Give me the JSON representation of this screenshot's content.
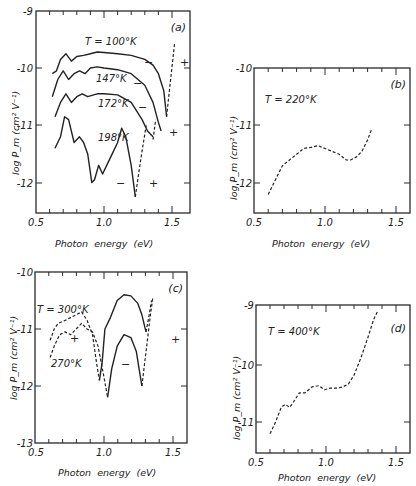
{
  "figure": {
    "x_axis_label": "Photon  energy  (eV)",
    "y_axis_label_m": "log  P_m  (cm² V⁻¹)",
    "x_ticks": [
      "0.5",
      "1.0",
      "1.5"
    ]
  },
  "panels": {
    "a": {
      "tag": "(a)",
      "y_ticks": [
        "-9",
        "-10",
        "-11",
        "-12"
      ],
      "curve_labels": [
        "T = 100°K",
        "147°K",
        "172°K",
        "198°K"
      ],
      "signs": [
        "−",
        "−",
        "−",
        "−",
        "+",
        "+",
        "+"
      ]
    },
    "b": {
      "tag": "(b)",
      "y_ticks": [
        "-10",
        "-11",
        "-12"
      ],
      "curve_labels": [
        "T = 220°K"
      ]
    },
    "c": {
      "tag": "(c)",
      "y_ticks": [
        "-10",
        "-11",
        "-12",
        "-13"
      ],
      "curve_labels": [
        "T = 300°K",
        "270°K"
      ],
      "signs": [
        "+",
        "−",
        "+"
      ]
    },
    "d": {
      "tag": "(d)",
      "y_ticks": [
        "-9",
        "-10",
        "-11"
      ],
      "curve_labels": [
        "T = 400°K"
      ]
    }
  },
  "chart_data": [
    {
      "type": "line",
      "title": "(a)",
      "xlabel": "Photon energy (eV)",
      "ylabel": "log P_m (cm^2 V^-1)",
      "xlim": [
        0.5,
        1.6
      ],
      "ylim": [
        -12.5,
        -9
      ],
      "x_ticks": [
        0.5,
        1.0,
        1.5
      ],
      "y_ticks": [
        -9,
        -10,
        -11,
        -12
      ],
      "grid": false,
      "series": [
        {
          "name": "T = 100°K",
          "style": "solid",
          "x": [
            0.62,
            0.65,
            0.68,
            0.72,
            0.76,
            0.8,
            0.85,
            0.9,
            0.95,
            1.0,
            1.1,
            1.2,
            1.3,
            1.36,
            1.4,
            1.44,
            1.46
          ],
          "y": [
            -10.1,
            -10.05,
            -9.85,
            -9.75,
            -9.88,
            -9.8,
            -9.78,
            -9.75,
            -9.72,
            -9.73,
            -9.75,
            -9.78,
            -9.85,
            -9.95,
            -10.1,
            -10.4,
            -10.85
          ]
        },
        {
          "name": "147°K",
          "style": "solid",
          "x": [
            0.62,
            0.66,
            0.7,
            0.74,
            0.78,
            0.82,
            0.86,
            0.9,
            0.95,
            1.0,
            1.1,
            1.2,
            1.3,
            1.36,
            1.4,
            1.42
          ],
          "y": [
            -10.5,
            -10.2,
            -10.05,
            -10.2,
            -10.1,
            -10.05,
            -10.1,
            -10.0,
            -9.98,
            -10.0,
            -10.03,
            -10.1,
            -10.3,
            -10.6,
            -10.95,
            -11.1
          ]
        },
        {
          "name": "172°K",
          "style": "solid",
          "x": [
            0.64,
            0.68,
            0.72,
            0.76,
            0.8,
            0.84,
            0.88,
            0.95,
            1.0,
            1.1,
            1.2,
            1.28,
            1.32,
            1.36
          ],
          "y": [
            -10.85,
            -10.6,
            -10.45,
            -10.6,
            -10.5,
            -10.45,
            -10.5,
            -10.45,
            -10.45,
            -10.47,
            -10.6,
            -10.9,
            -11.1,
            -11.2
          ]
        },
        {
          "name": "198°K",
          "style": "solid",
          "x": [
            0.64,
            0.68,
            0.71,
            0.74,
            0.78,
            0.82,
            0.85,
            0.88,
            0.91,
            0.93,
            0.96,
            0.99,
            1.02,
            1.06,
            1.1,
            1.13,
            1.16,
            1.2,
            1.23
          ],
          "y": [
            -11.4,
            -11.2,
            -10.85,
            -10.9,
            -11.3,
            -11.2,
            -11.3,
            -11.5,
            -12.0,
            -11.95,
            -11.7,
            -11.85,
            -11.7,
            -11.5,
            -11.3,
            -11.05,
            -11.2,
            -11.7,
            -12.25
          ]
        },
        {
          "name": "198°K (+)",
          "style": "dashed",
          "x": [
            1.23,
            1.27,
            1.31
          ],
          "y": [
            -12.25,
            -11.6,
            -11.0
          ]
        },
        {
          "name": "172°K (+)",
          "style": "dashed",
          "x": [
            1.36,
            1.38
          ],
          "y": [
            -11.25,
            -10.9
          ]
        },
        {
          "name": "100°K (+)",
          "style": "dashed",
          "x": [
            1.46,
            1.49,
            1.52
          ],
          "y": [
            -10.85,
            -10.2,
            -9.55
          ]
        }
      ]
    },
    {
      "type": "line",
      "title": "(b)",
      "xlabel": "Photon energy (eV)",
      "ylabel": "log P_m (cm^2 V^-1)",
      "xlim": [
        0.5,
        1.6
      ],
      "ylim": [
        -12.5,
        -10
      ],
      "x_ticks": [
        0.5,
        1.0,
        1.5
      ],
      "y_ticks": [
        -10,
        -11,
        -12
      ],
      "grid": false,
      "series": [
        {
          "name": "T = 220°K",
          "style": "dashed",
          "x": [
            0.6,
            0.65,
            0.7,
            0.75,
            0.8,
            0.85,
            0.9,
            0.95,
            1.0,
            1.05,
            1.1,
            1.15,
            1.18,
            1.22,
            1.26,
            1.3,
            1.33
          ],
          "y": [
            -12.2,
            -11.95,
            -11.7,
            -11.6,
            -11.5,
            -11.4,
            -11.38,
            -11.35,
            -11.4,
            -11.45,
            -11.5,
            -11.6,
            -11.6,
            -11.55,
            -11.45,
            -11.25,
            -11.05
          ]
        }
      ]
    },
    {
      "type": "line",
      "title": "(c)",
      "xlabel": "Photon energy (eV)",
      "ylabel": "log P_m (cm^2 V^-1)",
      "xlim": [
        0.5,
        1.6
      ],
      "ylim": [
        -13,
        -10
      ],
      "x_ticks": [
        0.5,
        1.0,
        1.5
      ],
      "y_ticks": [
        -10,
        -11,
        -12,
        -13
      ],
      "grid": false,
      "series": [
        {
          "name": "T = 300°K (+)",
          "style": "dashed",
          "x": [
            0.61,
            0.64,
            0.67,
            0.72,
            0.76,
            0.8,
            0.84,
            0.88,
            0.92,
            0.95,
            0.97
          ],
          "y": [
            -11.2,
            -11.0,
            -10.9,
            -10.85,
            -10.8,
            -10.75,
            -10.7,
            -10.85,
            -11.1,
            -11.6,
            -11.9
          ]
        },
        {
          "name": "T = 300°K (−)",
          "style": "solid",
          "x": [
            0.97,
            0.99,
            1.01,
            1.05,
            1.1,
            1.15,
            1.2,
            1.25,
            1.28,
            1.3,
            1.31
          ],
          "y": [
            -11.9,
            -11.6,
            -11.0,
            -10.8,
            -10.5,
            -10.4,
            -10.42,
            -10.55,
            -10.75,
            -10.95,
            -11.05
          ]
        },
        {
          "name": "T = 300°K (+, high)",
          "style": "dashed",
          "x": [
            1.31,
            1.33,
            1.35
          ],
          "y": [
            -11.05,
            -10.8,
            -10.5
          ]
        },
        {
          "name": "270°K (+)",
          "style": "dashed",
          "x": [
            0.61,
            0.64,
            0.68,
            0.72,
            0.76,
            0.8,
            0.84,
            0.88,
            0.92,
            0.96,
            1.0,
            1.03
          ],
          "y": [
            -11.5,
            -11.3,
            -11.1,
            -11.05,
            -11.1,
            -11.0,
            -10.9,
            -11.0,
            -11.05,
            -11.3,
            -11.8,
            -12.2
          ]
        },
        {
          "name": "270°K (−)",
          "style": "solid",
          "x": [
            1.03,
            1.06,
            1.1,
            1.15,
            1.2,
            1.24,
            1.26,
            1.28
          ],
          "y": [
            -12.2,
            -11.7,
            -11.3,
            -11.1,
            -11.15,
            -11.4,
            -11.7,
            -12.0
          ]
        },
        {
          "name": "270°K (+, high)",
          "style": "dashed",
          "x": [
            1.28,
            1.31,
            1.34,
            1.36
          ],
          "y": [
            -12.0,
            -11.4,
            -10.8,
            -10.45
          ]
        }
      ]
    },
    {
      "type": "line",
      "title": "(d)",
      "xlabel": "Photon energy (eV)",
      "ylabel": "log P_m (cm^2 V^-1)",
      "xlim": [
        0.5,
        1.6
      ],
      "ylim": [
        -11.5,
        -9
      ],
      "x_ticks": [
        0.5,
        1.0,
        1.5
      ],
      "y_ticks": [
        -9,
        -10,
        -11
      ],
      "grid": false,
      "series": [
        {
          "name": "T = 400°K",
          "style": "dashed",
          "x": [
            0.6,
            0.64,
            0.68,
            0.71,
            0.74,
            0.77,
            0.81,
            0.85,
            0.9,
            0.95,
            0.99,
            1.03,
            1.08,
            1.12,
            1.16,
            1.2,
            1.25,
            1.3,
            1.34,
            1.37
          ],
          "y": [
            -11.2,
            -11.0,
            -10.75,
            -10.7,
            -10.75,
            -10.65,
            -10.5,
            -10.5,
            -10.4,
            -10.38,
            -10.45,
            -10.42,
            -10.42,
            -10.4,
            -10.35,
            -10.2,
            -9.9,
            -9.55,
            -9.25,
            -9.1
          ]
        }
      ]
    }
  ]
}
